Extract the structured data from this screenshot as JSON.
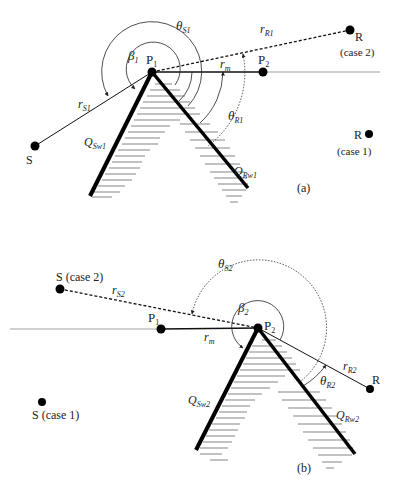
{
  "figure": {
    "panel_a": {
      "label": "(a)",
      "points": {
        "P1": {
          "text": "P",
          "sub": "1"
        },
        "P2": {
          "text": "P",
          "sub": "2"
        },
        "S": {
          "text": "S"
        },
        "R_case2": {
          "text": "R",
          "note": "(case 2)"
        },
        "R_case1": {
          "text": "R",
          "note": "(case 1)"
        }
      },
      "symbols": {
        "theta_S": {
          "main": "θ",
          "sub": "S1"
        },
        "beta": {
          "main": "β",
          "sub": "1"
        },
        "r_R": {
          "main": "r",
          "sub": "R1"
        },
        "r_m": {
          "main": "r",
          "sub": "m"
        },
        "r_S": {
          "main": "r",
          "sub": "S1"
        },
        "theta_R": {
          "main": "θ",
          "sub": "R1"
        },
        "Q_Sw": {
          "main": "Q",
          "sub": "Sw1"
        },
        "Q_Rw": {
          "main": "Q",
          "sub": "Rw1"
        }
      }
    },
    "panel_b": {
      "label": "(b)",
      "points": {
        "P1": {
          "text": "P",
          "sub": "1"
        },
        "P2": {
          "text": "P",
          "sub": "2"
        },
        "S_case2": {
          "text": "S",
          "note": "(case 2)"
        },
        "S_case1": {
          "text": "S",
          "note": "(case 1)"
        },
        "R": {
          "text": "R"
        }
      },
      "symbols": {
        "theta_S": {
          "main": "θ",
          "sub": "S2"
        },
        "beta": {
          "main": "β",
          "sub": "2"
        },
        "r_S": {
          "main": "r",
          "sub": "S2"
        },
        "r_m": {
          "main": "r",
          "sub": "m"
        },
        "r_R": {
          "main": "r",
          "sub": "R2"
        },
        "theta_R": {
          "main": "θ",
          "sub": "R2"
        },
        "Q_Sw": {
          "main": "Q",
          "sub": "Sw2"
        },
        "Q_Rw": {
          "main": "Q",
          "sub": "Rw2"
        }
      }
    }
  }
}
